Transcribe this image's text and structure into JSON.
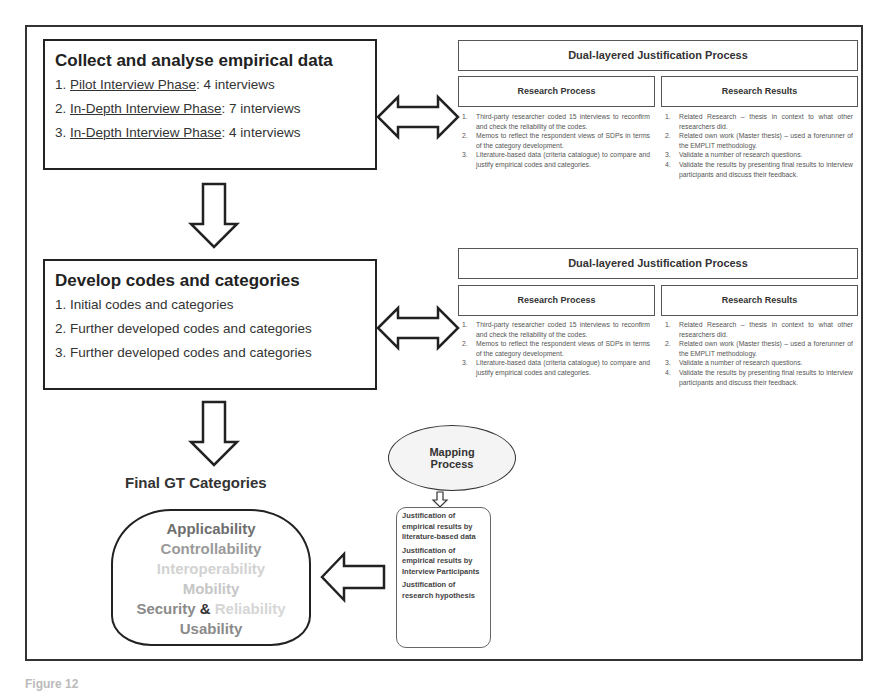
{
  "phases": [
    {
      "title": "Collect and analyse empirical data",
      "items": [
        {
          "num": "1. ",
          "link": "Pilot Interview Phase",
          "rest": ": 4 interviews"
        },
        {
          "num": "2. ",
          "link": "In-Depth Interview Phase",
          "rest": ": 7 interviews"
        },
        {
          "num": "3. ",
          "link": "In-Depth Interview Phase",
          "rest": ": 4 interviews"
        }
      ]
    },
    {
      "title": "Develop codes and categories",
      "items": [
        {
          "num": "1. ",
          "text": "Initial codes and categories"
        },
        {
          "num": "2. ",
          "text": "Further developed codes and categories"
        },
        {
          "num": "3. ",
          "text": "Further developed codes and categories"
        }
      ]
    }
  ],
  "justification": {
    "title": "Dual-layered Justification Process",
    "process_header": "Research Process",
    "results_header": "Research Results",
    "process_items": [
      {
        "num": "1.",
        "text": "Third-party researcher coded 15 interviews to reconfirm and check the reliability of the codes."
      },
      {
        "num": "2.",
        "text": "Memos to reflect the respondent views of SDPs in terms of the category development."
      },
      {
        "num": "3.",
        "text": "Literature-based data (criteria catalogue) to compare and justify empirical codes and categories."
      }
    ],
    "results_items": [
      {
        "num": "1.",
        "text": "Related Research – thesis in context to what other researchers did."
      },
      {
        "num": "2.",
        "text": "Related own work (Master thesis) – used a forerunner of the EMPLIT methodology."
      },
      {
        "num": "3.",
        "text": "Validate a number of research questions."
      },
      {
        "num": "4.",
        "text": "Validate the results by presenting final results to interview participants and discuss their feedback."
      }
    ]
  },
  "final": {
    "title": "Final GT Categories",
    "categories": [
      {
        "label": "Applicability",
        "color": "#6e6e6e"
      },
      {
        "label": "Controllability",
        "color": "#9a9a9a"
      },
      {
        "label": "Interoperability",
        "color": "#d2d2d2"
      },
      {
        "label": "Mobility",
        "color": "#c6c6c6"
      }
    ],
    "security": {
      "label": "Security",
      "color": "#8a8a8a"
    },
    "ampersand": {
      "label": "&",
      "color": "#333333"
    },
    "reliability": {
      "label": "Reliability",
      "color": "#d6d6d6"
    },
    "usability": {
      "label": "Usability",
      "color": "#8a8a8a"
    }
  },
  "mapping": {
    "line1": "Mapping",
    "line2": "Process",
    "items": [
      "Justification of empirical results by literature-based data",
      "Justification of empirical results by Interview Participants",
      "Justification of research hypothesis"
    ]
  },
  "caption": "Figure 12"
}
